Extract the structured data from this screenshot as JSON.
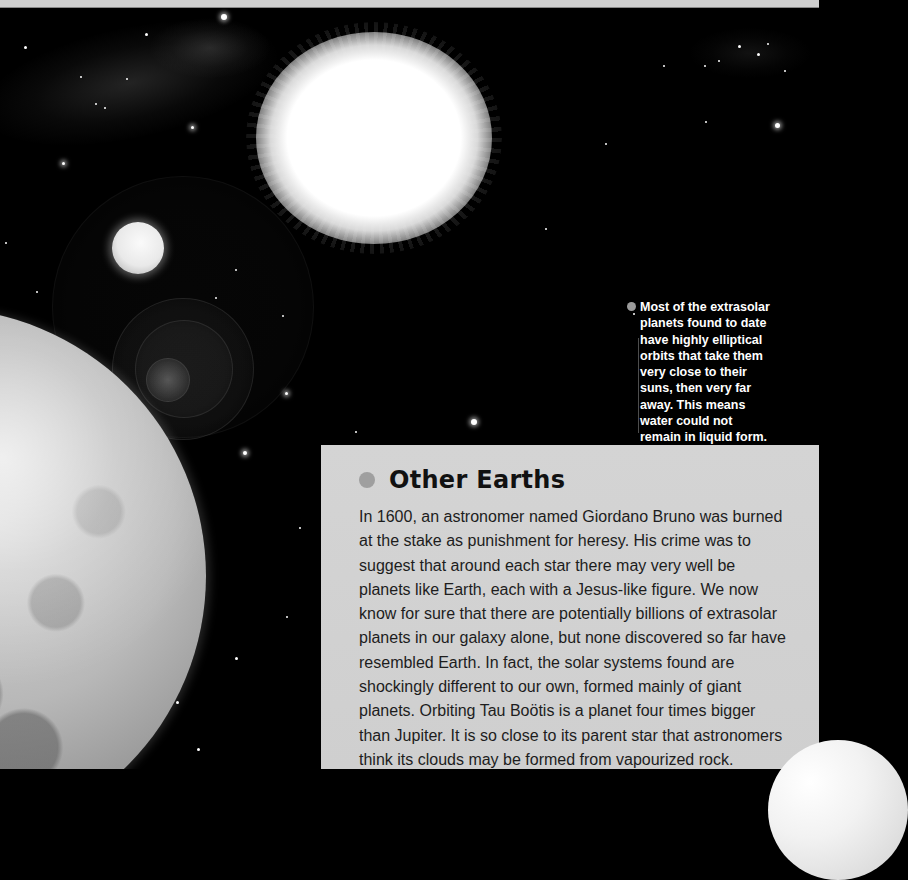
{
  "page": {
    "background_color": "#000000",
    "top_strip_color": "#cfcfcf"
  },
  "illustration": {
    "elements": [
      "star-field",
      "bright-star-sun",
      "small-moon",
      "large-planet",
      "lens-flare",
      "partial-planet-corner"
    ]
  },
  "side_caption": {
    "bullet_color": "#9b9b9b",
    "lines": [
      "Most of the extrasolar",
      "planets found to date",
      "have highly elliptical",
      "orbits that take them",
      "very close to their",
      "suns, then very far",
      "away. This means",
      "water could not",
      "remain in liquid form."
    ]
  },
  "article": {
    "box_color": "#d1d1d1",
    "bullet_color": "#9f9f9f",
    "heading": "Other Earths",
    "lines": [
      "In 1600, an astronomer named Giordano Bruno was burned",
      "at the stake as punishment for heresy. His crime was to",
      "suggest that around each star there may very well be",
      "planets like Earth, each with a Jesus-like figure. We now",
      "know for sure that there are potentially billions of extrasolar",
      "planets in our galaxy alone, but none discovered so far have",
      "resembled Earth. In fact, the solar systems found are",
      "shockingly different to our own, formed mainly of giant",
      "planets. Orbiting Tau Boötis is a planet four times bigger",
      "than Jupiter. It is so close to its parent star that astronomers",
      "think its clouds may be formed from vapourized rock."
    ]
  }
}
